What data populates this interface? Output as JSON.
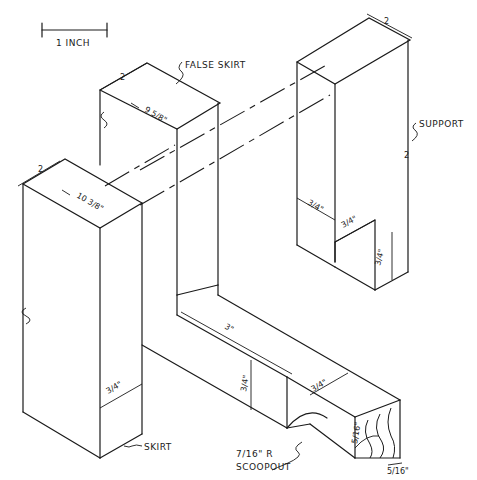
{
  "drawing": {
    "type": "isometric woodworking detail",
    "scale_bar": {
      "label": "1 INCH"
    },
    "callouts": {
      "false_skirt": "FALSE SKIRT",
      "support": "SUPPORT",
      "skirt": "SKIRT",
      "scoopout_line1": "7/16\" R",
      "scoopout_line2": "SCOOPOUT"
    },
    "dimensions": {
      "skirt_length": "10 3/8\"",
      "false_skirt_length": "9 5/8\"",
      "skirt_thickness": "3/4\"",
      "support_thickness": "3/4\"",
      "support_notch_width": "3/4\"",
      "support_notch_height": "3/4\"",
      "rail_length": "3\"",
      "rail_height": "3/4\"",
      "rail_width": "3/4\"",
      "end_height": "5/16\"",
      "end_width": "5/16\""
    },
    "break_marks": [
      "2",
      "2",
      "2",
      "2"
    ]
  }
}
